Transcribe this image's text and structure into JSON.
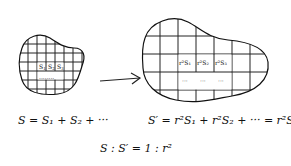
{
  "diagram": {
    "small_figure": {
      "cell_labels": [
        "S",
        "S",
        "S"
      ],
      "cell_subscripts": [
        "1",
        "2",
        "3"
      ],
      "dots": "........",
      "formula": "S = S₁ + S₂ + ···"
    },
    "arrow": {
      "direction": "right"
    },
    "large_figure": {
      "cell_labels": [
        "r²S₁",
        "r²S₂",
        "r²S₃"
      ],
      "dots": [
        "···",
        "···",
        "···"
      ],
      "formula": "S′ = r²S₁ + r²S₂ + ··· = r²S"
    },
    "ratio": "S : S′ = 1 : r²"
  }
}
